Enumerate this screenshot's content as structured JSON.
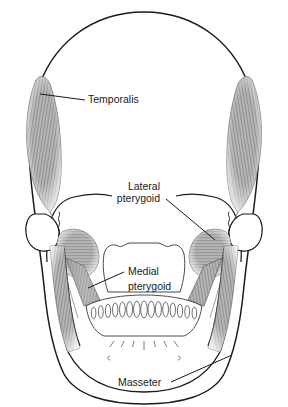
{
  "figure": {
    "view": "anterior",
    "background_color": "#ffffff",
    "ink_color": "#1a1a1a",
    "muscle_fill": "#9a9a9a"
  },
  "labels": [
    {
      "id": "temporalis",
      "name": "Temporalis",
      "lines": [
        "Temporalis"
      ],
      "text_x": 88,
      "text_y": 103,
      "anchor": "start",
      "leader": {
        "from_x": 85,
        "from_y": 100,
        "to_x": 40,
        "to_y": 94
      }
    },
    {
      "id": "lateral-pterygoid",
      "name": "Lateral pterygoid",
      "lines": [
        "Lateral",
        "pterygoid"
      ],
      "text_x": 160,
      "text_y": 190,
      "anchor": "end",
      "leader": {
        "from_x": 166,
        "from_y": 199,
        "to_x": 215,
        "to_y": 240
      }
    },
    {
      "id": "medial-pterygoid",
      "name": "Medial pterygoid",
      "lines": [
        "Medial",
        "pterygoid"
      ],
      "text_x": 128,
      "text_y": 275,
      "anchor": "start",
      "leader": {
        "from_x": 124,
        "from_y": 272,
        "to_x": 88,
        "to_y": 288
      }
    },
    {
      "id": "masseter",
      "name": "Masseter",
      "lines": [
        "Masseter"
      ],
      "text_x": 118,
      "text_y": 386,
      "anchor": "start",
      "leader": {
        "from_x": 171,
        "from_y": 382,
        "to_x": 232,
        "to_y": 355
      }
    }
  ],
  "structures": [
    {
      "id": "cranium",
      "name": "Cranial vault"
    },
    {
      "id": "orbit-left",
      "name": "Left orbital region"
    },
    {
      "id": "orbit-right",
      "name": "Right orbital region"
    },
    {
      "id": "maxilla",
      "name": "Maxilla / palate arch"
    },
    {
      "id": "mandible",
      "name": "Mandible"
    },
    {
      "id": "condyle-left",
      "name": "Left mandibular condyle"
    },
    {
      "id": "condyle-right",
      "name": "Right mandibular condyle"
    },
    {
      "id": "teeth",
      "name": "Mandibular dental arch"
    }
  ],
  "teeth": {
    "count": 15
  },
  "chin_marks": {
    "tick_count": 7,
    "foramen_count": 2
  }
}
